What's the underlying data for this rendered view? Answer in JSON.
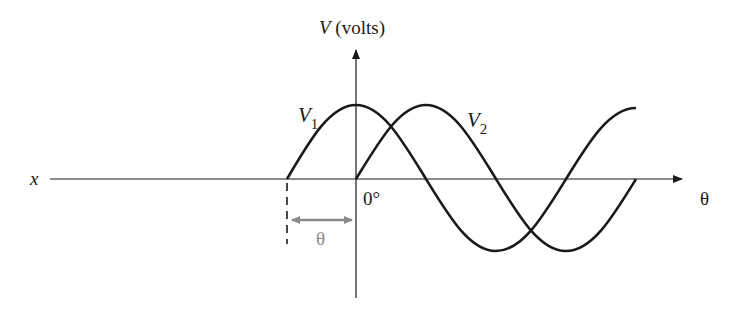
{
  "diagram": {
    "y_axis_label_var": "V",
    "y_axis_label_unit": " (volts)",
    "x_axis_left_label": "x",
    "x_axis_right_label": "θ",
    "origin_label": "0°",
    "phase_label": "θ",
    "curves": [
      {
        "name": "V1",
        "label_var": "V",
        "label_sub": "1",
        "phase_deg": 90,
        "description": "leads by θ (starts at -90°)"
      },
      {
        "name": "V2",
        "label_var": "V",
        "label_sub": "2",
        "phase_deg": 0,
        "description": "starts at 0°"
      }
    ],
    "colors": {
      "line": "#1a1a1a",
      "phase_arrow": "#8a8a8a"
    }
  }
}
